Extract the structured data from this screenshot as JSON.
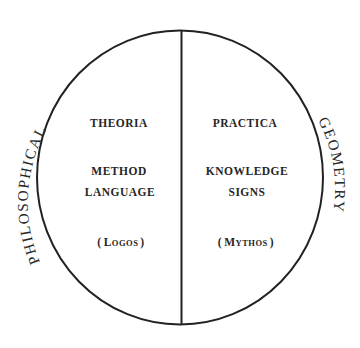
{
  "diagram": {
    "type": "split-circle",
    "stroke_color": "#222222",
    "text_color": "#262626",
    "background": "#ffffff",
    "outer_labels": {
      "left": "PHILOSOPHICAL",
      "right": "GEOMETRY"
    },
    "left_half": {
      "heading": "THEORIA",
      "lines": [
        "METHOD",
        "LANGUAGE"
      ],
      "paren_open": "(",
      "paren_initial": "L",
      "paren_rest": "OGOS",
      "paren_close": ")"
    },
    "right_half": {
      "heading": "PRACTICA",
      "lines": [
        "KNOWLEDGE",
        "SIGNS"
      ],
      "paren_open": "(",
      "paren_initial": "M",
      "paren_rest": "YTHOS",
      "paren_close": ")"
    }
  }
}
